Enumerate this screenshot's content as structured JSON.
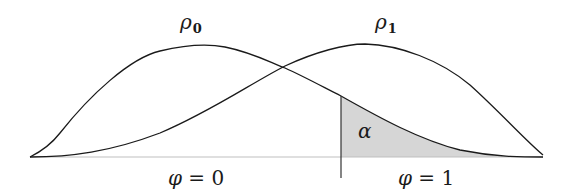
{
  "figure": {
    "curves": [
      {
        "name": "rho0",
        "label_symbol": "ρ",
        "label_subscript": "0"
      },
      {
        "name": "rho1",
        "label_symbol": "ρ",
        "label_subscript": "1"
      }
    ],
    "shaded_region": {
      "label": "α",
      "fill": "#d6d6d6"
    },
    "regions": [
      {
        "label_var": "φ",
        "label_rest": " = 0"
      },
      {
        "label_var": "φ",
        "label_rest": " = 1"
      }
    ],
    "colors": {
      "line": "#1a1a1a",
      "baseline": "#bfbfbf",
      "shade": "#d6d6d6"
    }
  }
}
